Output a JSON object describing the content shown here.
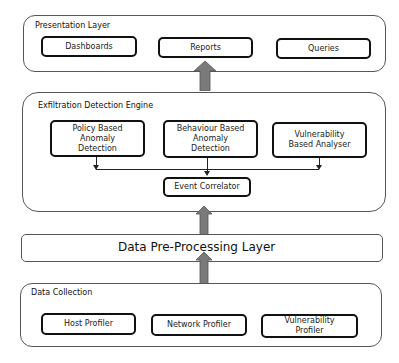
{
  "presentation_layer": {
    "title": "Presentation Layer",
    "components": [
      "Dashboards",
      "Reports",
      "Queries"
    ]
  },
  "detection_engine": {
    "title": "Exfiltration  Detection Engine",
    "components": [
      "Policy Based\nAnomaly\nDetection",
      "Behaviour Based\nAnomaly\nDetection",
      "Vulnerability\nBased Analyser"
    ],
    "correlator": "Event  Correlator"
  },
  "preprocessing_layer": {
    "title": "Data  Pre-Processing Layer"
  },
  "data_collection": {
    "title": "Data Collection",
    "components": [
      "Host Profiler",
      "Network  Profiler",
      "Vulnerability\nProfiler"
    ]
  },
  "colors": {
    "arrow": "#7a7a7a",
    "border": "#111111",
    "layer_border": "#555555"
  }
}
